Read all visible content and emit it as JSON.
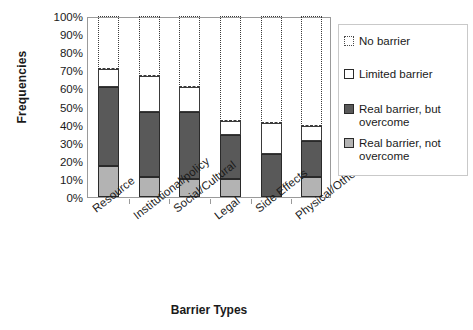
{
  "chart_data": {
    "type": "bar",
    "subtype": "stacked-bar-100percent",
    "title": "",
    "xlabel": "Barrier Types",
    "ylabel": "Frequencies",
    "categories": [
      "Resource",
      "Institutional/policy",
      "Social/Cultural",
      "Legal",
      "Side Effects",
      "Physical/Other"
    ],
    "ylim": [
      0,
      100
    ],
    "ytick_labels": [
      "0%",
      "10%",
      "20%",
      "30%",
      "40%",
      "50%",
      "60%",
      "70%",
      "80%",
      "90%",
      "100%"
    ],
    "ytick_values": [
      0,
      10,
      20,
      30,
      40,
      50,
      60,
      70,
      80,
      90,
      100
    ],
    "grid": false,
    "legend_position": "right",
    "series": [
      {
        "name": "Real barrier, not overcome",
        "key": "realnot",
        "color": "#b3b3b3",
        "values": [
          17,
          11,
          10,
          10,
          0,
          11
        ]
      },
      {
        "name": "Real barrier, but overcome",
        "key": "realbut",
        "color": "#595959",
        "values": [
          44,
          36,
          37,
          24,
          24,
          20
        ]
      },
      {
        "name": "Limited barrier",
        "key": "limited",
        "color": "#ffffff",
        "values": [
          10,
          20,
          14,
          8,
          17,
          8
        ]
      },
      {
        "name": "No barrier",
        "key": "nobarrier",
        "color": "#ffffff",
        "values": [
          29,
          33,
          39,
          58,
          59,
          61
        ]
      }
    ],
    "segment_tops": {
      "Resource": {
        "realnot": 17,
        "realbut": 61,
        "limited": 71,
        "nobarrier": 100
      },
      "Institutional/policy": {
        "realnot": 11,
        "realbut": 47,
        "limited": 67,
        "nobarrier": 100
      },
      "Social/Cultural": {
        "realnot": 10,
        "realbut": 47,
        "limited": 61,
        "nobarrier": 100
      },
      "Legal": {
        "realnot": 10,
        "realbut": 34,
        "limited": 42,
        "nobarrier": 100
      },
      "Side Effects": {
        "realnot": 0,
        "realbut": 24,
        "limited": 41,
        "nobarrier": 100
      },
      "Physical/Other": {
        "realnot": 11,
        "realbut": 31,
        "limited": 39,
        "nobarrier": 100
      }
    }
  },
  "legend": {
    "items": [
      {
        "label": "No barrier",
        "key": "nobarrier"
      },
      {
        "label": "Limited barrier",
        "key": "limited"
      },
      {
        "label": "Real barrier, but\novercome",
        "key": "realbut"
      },
      {
        "label": "Real barrier, not\novercome",
        "key": "realnot"
      }
    ]
  }
}
